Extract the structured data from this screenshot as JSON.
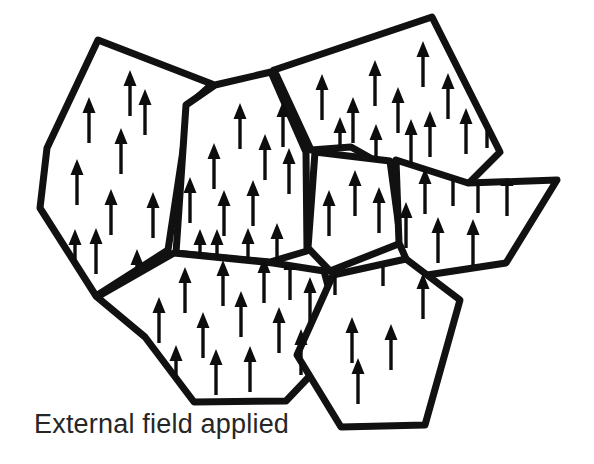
{
  "figure": {
    "caption": "External field applied",
    "caption_position": {
      "x": 34,
      "y": 433
    },
    "canvas": {
      "width": 594,
      "height": 464
    },
    "colors": {
      "background": "#ffffff",
      "grain_boundary": "#111111",
      "grain_fill": "#ffffff",
      "arrow": "#0d0d0d",
      "caption": "#262626"
    },
    "style": {
      "boundary_stroke_width": 7,
      "arrow_length": 46,
      "arrow_head_width": 13,
      "arrow_head_length": 16,
      "arrow_shaft_width": 3.4
    }
  },
  "diagram_data": {
    "type": "schematic",
    "description": "Seven irregular polygonal grains separated by thick grain boundaries; every grain contains upward-pointing arrows indicating magnetic domains all aligned with an applied external field.",
    "arrow_direction_degrees": 90,
    "all_domains_aligned": true,
    "grain_count": 7,
    "arrow_count_total": 58,
    "grains": [
      {
        "id": "grain-upper-left",
        "label": "Upper left grain",
        "arrow_count": 10,
        "polygon": [
          [
            98,
            40
          ],
          [
            212,
            84
          ],
          [
            190,
            104
          ],
          [
            168,
            250
          ],
          [
            96,
            296
          ],
          [
            40,
            208
          ],
          [
            47,
            148
          ]
        ],
        "arrows": [
          [
            89,
            120
          ],
          [
            121,
            151
          ],
          [
            77,
            182
          ],
          [
            111,
            212
          ],
          [
            145,
            112
          ],
          [
            130,
            93
          ],
          [
            96,
            251
          ],
          [
            137,
            272
          ],
          [
            75,
            252
          ],
          [
            153,
            215
          ]
        ]
      },
      {
        "id": "grain-upper-middle",
        "label": "Upper middle grain",
        "arrow_count": 12,
        "polygon": [
          [
            215,
            85
          ],
          [
            271,
            72
          ],
          [
            306,
            152
          ],
          [
            307,
            251
          ],
          [
            270,
            262
          ],
          [
            176,
            253
          ],
          [
            186,
            105
          ]
        ],
        "arrows": [
          [
            240,
            126
          ],
          [
            214,
            166
          ],
          [
            190,
            200
          ],
          [
            265,
            157
          ],
          [
            224,
            213
          ],
          [
            253,
            203
          ],
          [
            283,
            124
          ],
          [
            289,
            171
          ],
          [
            217,
            252
          ],
          [
            248,
            251
          ],
          [
            277,
            246
          ],
          [
            200,
            252
          ]
        ]
      },
      {
        "id": "grain-upper-right",
        "label": "Upper right grain",
        "arrow_count": 13,
        "polygon": [
          [
            274,
            70
          ],
          [
            432,
            17
          ],
          [
            500,
            152
          ],
          [
            468,
            184
          ],
          [
            404,
            177
          ],
          [
            351,
            147
          ],
          [
            311,
            150
          ]
        ],
        "arrows": [
          [
            322,
            97
          ],
          [
            375,
            83
          ],
          [
            423,
            64
          ],
          [
            353,
            120
          ],
          [
            398,
            110
          ],
          [
            448,
            96
          ],
          [
            411,
            142
          ],
          [
            466,
            131
          ],
          [
            340,
            140
          ],
          [
            376,
            147
          ],
          [
            430,
            134
          ],
          [
            487,
            125
          ],
          [
            351,
            172
          ]
        ]
      },
      {
        "id": "grain-center-small",
        "label": "Central small grain",
        "arrow_count": 3,
        "polygon": [
          [
            315,
            152
          ],
          [
            390,
            161
          ],
          [
            401,
            243
          ],
          [
            330,
            271
          ],
          [
            308,
            248
          ]
        ],
        "arrows": [
          [
            329,
            213
          ],
          [
            355,
            193
          ],
          [
            379,
            210
          ]
        ]
      },
      {
        "id": "grain-middle-right",
        "label": "Middle right grain",
        "arrow_count": 7,
        "polygon": [
          [
            396,
            160
          ],
          [
            468,
            183
          ],
          [
            557,
            180
          ],
          [
            506,
            263
          ],
          [
            414,
            277
          ],
          [
            399,
            243
          ]
        ],
        "arrows": [
          [
            406,
            225
          ],
          [
            425,
            191
          ],
          [
            453,
            183
          ],
          [
            478,
            190
          ],
          [
            507,
            193
          ],
          [
            438,
            240
          ],
          [
            473,
            242
          ]
        ]
      },
      {
        "id": "grain-lower-left",
        "label": "Lower left grain",
        "arrow_count": 13,
        "polygon": [
          [
            174,
            253
          ],
          [
            273,
            263
          ],
          [
            324,
            271
          ],
          [
            343,
            341
          ],
          [
            286,
            401
          ],
          [
            194,
            402
          ],
          [
            145,
            337
          ],
          [
            97,
            297
          ]
        ],
        "arrows": [
          [
            185,
            290
          ],
          [
            223,
            283
          ],
          [
            264,
            280
          ],
          [
            290,
            277
          ],
          [
            203,
            335
          ],
          [
            241,
            314
          ],
          [
            279,
            330
          ],
          [
            176,
            368
          ],
          [
            216,
            372
          ],
          [
            250,
            369
          ],
          [
            301,
            352
          ],
          [
            159,
            320
          ],
          [
            310,
            300
          ]
        ]
      },
      {
        "id": "grain-lower-center",
        "label": "Lower center grain",
        "arrow_count": 6,
        "polygon": [
          [
            333,
            275
          ],
          [
            406,
            259
          ],
          [
            460,
            300
          ],
          [
            425,
            425
          ],
          [
            341,
            427
          ],
          [
            297,
            355
          ]
        ],
        "arrows": [
          [
            335,
            272
          ],
          [
            383,
            263
          ],
          [
            423,
            296
          ],
          [
            352,
            340
          ],
          [
            391,
            347
          ],
          [
            358,
            381
          ]
        ]
      }
    ]
  }
}
